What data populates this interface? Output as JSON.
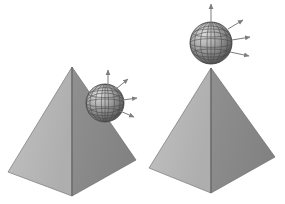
{
  "figure": {
    "title": "",
    "background_color": "#ffffff",
    "width": 285,
    "height": 204,
    "style": "grayscale 3d rendered illustration, wireframe globe on pyramid"
  },
  "colors": {
    "background": "#ffffff",
    "pyramid_left_face": "#b9b9b9",
    "pyramid_right_face": "#8b8b8b",
    "pyramid_edge": "#6a6a6a",
    "pyramid_base_shadow": "#9a9a9a",
    "sphere_light": "#d4d4d4",
    "sphere_mid": "#9e9e9e",
    "sphere_dark": "#5e5e5e",
    "sphere_wire": "#4a4a4a",
    "arrow": "#8e8e8e",
    "arrow_dark": "#6e6e6e"
  },
  "panels": [
    {
      "id": "panel-left",
      "name": "unstable-equilibrium-panel",
      "caption": "",
      "pyramid": {
        "apex": {
          "x": 72,
          "y": 67
        },
        "base_left": {
          "x": 8,
          "y": 172
        },
        "base_front": {
          "x": 72,
          "y": 196
        },
        "base_right": {
          "x": 136,
          "y": 160
        },
        "left_face_shade": "#b9b9b9",
        "right_face_shade": "#8b8b8b"
      },
      "sphere": {
        "center": {
          "x": 105,
          "y": 103
        },
        "radius": 19,
        "position_label": "on-slope",
        "wire_meridians": 8,
        "wire_parallels": 5
      },
      "arrows": [
        {
          "id": "a1",
          "from": {
            "x": 108,
            "y": 86
          },
          "to": {
            "x": 108,
            "y": 70
          },
          "label": ""
        },
        {
          "id": "a2",
          "from": {
            "x": 116,
            "y": 88
          },
          "to": {
            "x": 128,
            "y": 79
          },
          "label": ""
        },
        {
          "id": "a3",
          "from": {
            "x": 122,
            "y": 100
          },
          "to": {
            "x": 136,
            "y": 98
          },
          "label": ""
        },
        {
          "id": "a4",
          "from": {
            "x": 120,
            "y": 110
          },
          "to": {
            "x": 134,
            "y": 116
          },
          "label": ""
        }
      ]
    },
    {
      "id": "panel-right",
      "name": "balanced-equilibrium-panel",
      "caption": "",
      "pyramid": {
        "apex": {
          "x": 211,
          "y": 68
        },
        "base_left": {
          "x": 149,
          "y": 168
        },
        "base_front": {
          "x": 211,
          "y": 193
        },
        "base_right": {
          "x": 275,
          "y": 157
        },
        "left_face_shade": "#b9b9b9",
        "right_face_shade": "#8b8b8b"
      },
      "sphere": {
        "center": {
          "x": 211,
          "y": 43
        },
        "radius": 21,
        "position_label": "on-apex",
        "wire_meridians": 8,
        "wire_parallels": 5
      },
      "arrows": [
        {
          "id": "b1",
          "from": {
            "x": 211,
            "y": 26
          },
          "to": {
            "x": 211,
            "y": 4
          },
          "label": ""
        },
        {
          "id": "b2",
          "from": {
            "x": 228,
            "y": 28
          },
          "to": {
            "x": 243,
            "y": 20
          },
          "label": ""
        },
        {
          "id": "b3",
          "from": {
            "x": 232,
            "y": 40
          },
          "to": {
            "x": 250,
            "y": 37
          },
          "label": ""
        },
        {
          "id": "b4",
          "from": {
            "x": 230,
            "y": 52
          },
          "to": {
            "x": 249,
            "y": 55
          },
          "label": ""
        }
      ]
    }
  ]
}
